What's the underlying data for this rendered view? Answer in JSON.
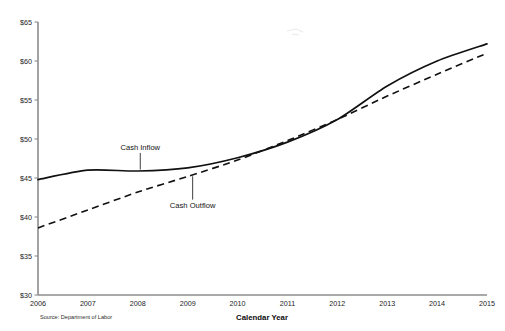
{
  "chart_data": {
    "type": "line",
    "title": "",
    "xlabel": "Calendar Year",
    "ylabel": "",
    "source_note": "Source: Department of Labor",
    "categories": [
      "2006",
      "2007",
      "2008",
      "2009",
      "2010",
      "2011",
      "2012",
      "2013",
      "2014",
      "2015"
    ],
    "x": [
      2006,
      2007,
      2008,
      2009,
      2010,
      2011,
      2012,
      2013,
      2014,
      2015
    ],
    "ylim": [
      30,
      65
    ],
    "yticks": [
      30,
      35,
      40,
      45,
      50,
      55,
      60,
      65
    ],
    "ytick_labels": [
      "$30",
      "$35",
      "$40",
      "$45",
      "$50",
      "$55",
      "$60",
      "$65"
    ],
    "grid": false,
    "legend_position": "inline-annotations",
    "series": [
      {
        "name": "Cash Inflow",
        "style": "solid",
        "color": "#111111",
        "values": [
          44.8,
          46.0,
          45.9,
          46.3,
          47.6,
          49.6,
          52.5,
          56.8,
          60.0,
          62.2
        ]
      },
      {
        "name": "Cash Outflow",
        "style": "dashed",
        "color": "#111111",
        "values": [
          38.6,
          40.9,
          43.2,
          45.2,
          47.3,
          49.8,
          52.5,
          55.5,
          58.3,
          61.0
        ]
      }
    ],
    "annotations": [
      {
        "text": "Cash Inflow",
        "label_x": 2008.05,
        "label_y": 48.6,
        "point_x": 2008.05,
        "point_y": 45.95
      },
      {
        "text": "Cash Outflow",
        "label_x": 2009.1,
        "label_y": 41.2,
        "point_x": 2009.1,
        "point_y": 45.35
      }
    ]
  },
  "axes": {
    "y_axis_name": "dollars-axis",
    "x_axis_name": "calendar-year-axis"
  }
}
